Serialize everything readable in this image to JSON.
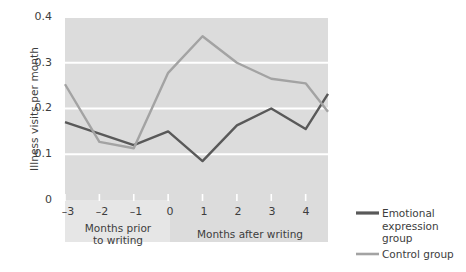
{
  "chart_data": {
    "type": "line",
    "title": "",
    "xlabel": "",
    "ylabel": "Illness visits per month",
    "x": [
      -3,
      -2,
      -1,
      0,
      1,
      2,
      3,
      4
    ],
    "xtick_labels": [
      "–3",
      "–2",
      "–1",
      "0",
      "1",
      "2",
      "3",
      "4"
    ],
    "ytick_labels": [
      "0.4",
      "0.3",
      "0.2",
      "0.1",
      "0"
    ],
    "ytick_values": [
      0.4,
      0.3,
      0.2,
      0.1,
      0
    ],
    "ylim": [
      0,
      0.4
    ],
    "xlim": [
      -3,
      4.65
    ],
    "grid": "horizontal",
    "legend_position": "right",
    "series": [
      {
        "name": "Emotional expression group",
        "color": "#595959",
        "values": [
          0.17,
          0.145,
          0.12,
          0.15,
          0.085,
          0.163,
          0.2,
          0.155
        ],
        "endpoint_x": 4.65,
        "endpoint_value": 0.232
      },
      {
        "name": "Control group",
        "color": "#a3a3a3",
        "values": [
          0.253,
          0.127,
          0.113,
          0.278,
          0.358,
          0.3,
          0.265,
          0.255
        ],
        "endpoint_x": 4.65,
        "endpoint_value": 0.193
      }
    ],
    "x_band_labels": [
      {
        "text": "Months prior\nto writing",
        "from": -3,
        "to": 0
      },
      {
        "text": "Months after writing",
        "from": 0,
        "to": 4.65
      }
    ],
    "plot_bg_color": "#dcdcdc",
    "band_bg_color": "#e6e6e6",
    "gridline_color": "#ffffff"
  },
  "axis": {
    "y_title": "Illness visits per month",
    "y_ticks": [
      "0.4",
      "0.3",
      "0.2",
      "0.1",
      "0"
    ],
    "x_ticks": [
      "–3",
      "–2",
      "–1",
      "0",
      "1",
      "2",
      "3",
      "4"
    ],
    "band_prior_line1": "Months prior",
    "band_prior_line2": "to writing",
    "band_after": "Months after writing"
  },
  "legend": {
    "items": [
      {
        "label": "Emotional\nexpression group",
        "color": "#595959"
      },
      {
        "label": "Control group",
        "color": "#a3a3a3"
      }
    ]
  }
}
